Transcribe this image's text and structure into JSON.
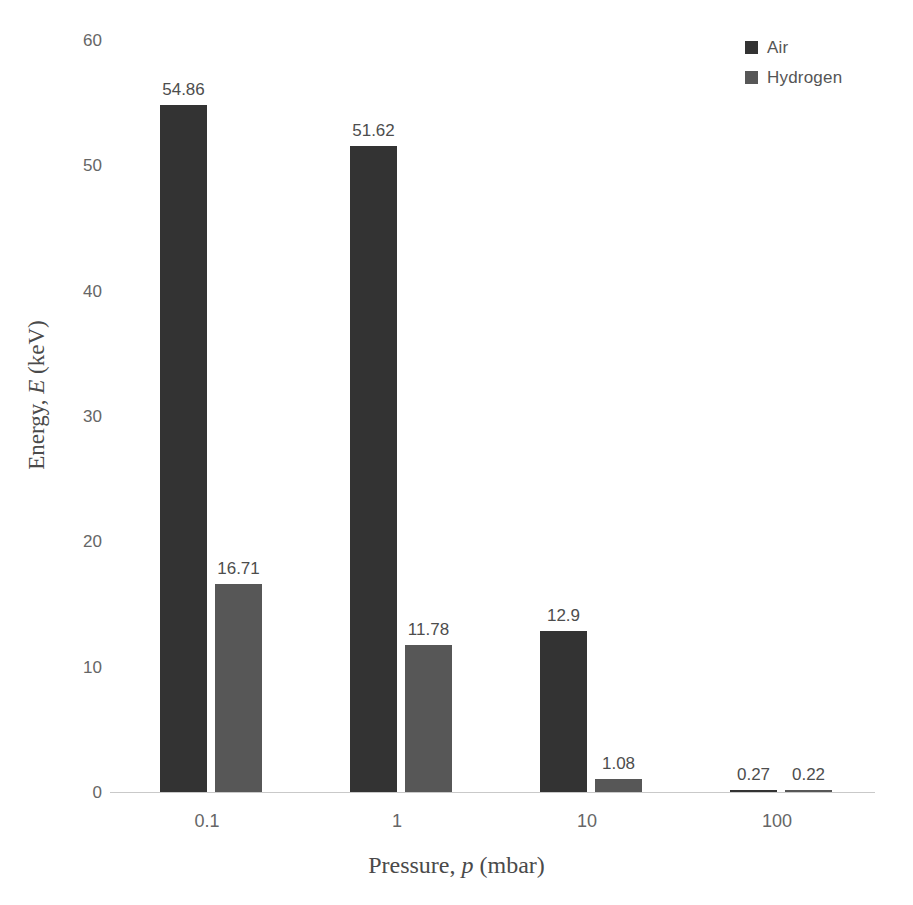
{
  "chart_data": {
    "type": "bar",
    "title": "",
    "subtitle": "",
    "xlabel_prefix": "Pressure, ",
    "xlabel_variable": "p",
    "xlabel_suffix": " (mbar)",
    "ylabel_prefix": "Energy, ",
    "ylabel_variable": "E",
    "ylabel_suffix": " (keV)",
    "categories": [
      "0.1",
      "1",
      "10",
      "100"
    ],
    "series": [
      {
        "name": "Air",
        "color": "#333333",
        "values": [
          54.86,
          51.62,
          12.9,
          0.27
        ],
        "labels": [
          "54.86",
          "51.62",
          "12.9",
          "0.27"
        ]
      },
      {
        "name": "Hydrogen",
        "color": "#575757",
        "values": [
          16.71,
          11.78,
          1.08,
          0.22
        ],
        "labels": [
          "16.71",
          "11.78",
          "1.08",
          "0.22"
        ]
      }
    ],
    "ylim": [
      0,
      60
    ],
    "yticks": [
      0,
      10,
      20,
      30,
      40,
      50,
      60
    ],
    "ytick_labels": [
      "0",
      "10",
      "20",
      "30",
      "40",
      "50",
      "60"
    ],
    "grid": false,
    "legend_position": "top-right",
    "axis_color": "#c9c9c9",
    "tick_label_color": "#666666",
    "data_label_color": "#4d4d4d",
    "background": "#ffffff"
  }
}
